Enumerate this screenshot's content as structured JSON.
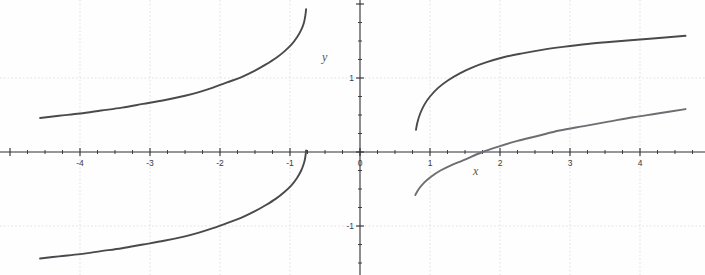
{
  "figure": {
    "title": "",
    "background_color": "#fefefe",
    "curve_color": "#4a4a4e",
    "curve_color_light": "#6d6d72",
    "axis_color": "#2f2f34",
    "gridline_color": "#e8dedf",
    "width": 705,
    "height": 275
  },
  "axes": {
    "x_label": "x",
    "y_label": "y",
    "origin_px": {
      "x": 360,
      "y": 152
    },
    "px_per_unit_x": 70,
    "px_per_unit_y": 74,
    "xlim": [
      -5.14,
      4.93
    ],
    "ylim": [
      -1.66,
      2.05
    ],
    "x_ticks_major": [
      -4,
      -3,
      -2,
      -1,
      0,
      1,
      2,
      3,
      4
    ],
    "x_tick_labels": [
      "-4",
      "-3",
      "-2",
      "-1",
      "0",
      "1",
      "2",
      "3",
      "4"
    ],
    "y_ticks_major": [
      -1,
      0,
      1
    ],
    "y_tick_labels": [
      "-1",
      "0",
      "1"
    ],
    "minor_tick_step": 0.25,
    "grid": true,
    "grid_x_lines": [
      -4,
      -3,
      -2,
      -1,
      1,
      2,
      3,
      4
    ],
    "grid_y_lines": [
      -1,
      1
    ]
  },
  "chart_data": {
    "type": "line",
    "title": "",
    "xlabel": "x",
    "ylabel": "y",
    "xlim": [
      -5.14,
      4.93
    ],
    "ylim": [
      -1.66,
      2.05
    ],
    "grid": true,
    "legend": "none",
    "x_ticks": [
      -4,
      -3,
      -2,
      -1,
      0,
      1,
      2,
      3,
      4
    ],
    "y_ticks": [
      -1,
      0,
      1
    ],
    "series": [
      {
        "name": "left-upper-branch",
        "color": "#4a4a4e",
        "points": [
          [
            -4.57,
            0.46
          ],
          [
            -4.3,
            0.49
          ],
          [
            -4.0,
            0.52
          ],
          [
            -3.7,
            0.56
          ],
          [
            -3.4,
            0.6
          ],
          [
            -3.1,
            0.65
          ],
          [
            -2.8,
            0.7
          ],
          [
            -2.5,
            0.76
          ],
          [
            -2.3,
            0.81
          ],
          [
            -2.1,
            0.87
          ],
          [
            -1.9,
            0.94
          ],
          [
            -1.7,
            1.01
          ],
          [
            -1.5,
            1.1
          ],
          [
            -1.35,
            1.18
          ],
          [
            -1.2,
            1.27
          ],
          [
            -1.08,
            1.36
          ],
          [
            -0.98,
            1.45
          ],
          [
            -0.9,
            1.55
          ],
          [
            -0.84,
            1.65
          ],
          [
            -0.8,
            1.75
          ],
          [
            -0.78,
            1.85
          ],
          [
            -0.77,
            1.93
          ]
        ]
      },
      {
        "name": "left-lower-branch",
        "color": "#4a4a4e",
        "points": [
          [
            -4.57,
            -1.44
          ],
          [
            -4.3,
            -1.41
          ],
          [
            -4.0,
            -1.38
          ],
          [
            -3.7,
            -1.34
          ],
          [
            -3.4,
            -1.3
          ],
          [
            -3.1,
            -1.25
          ],
          [
            -2.8,
            -1.2
          ],
          [
            -2.5,
            -1.14
          ],
          [
            -2.3,
            -1.09
          ],
          [
            -2.1,
            -1.03
          ],
          [
            -1.9,
            -0.96
          ],
          [
            -1.7,
            -0.89
          ],
          [
            -1.5,
            -0.8
          ],
          [
            -1.35,
            -0.72
          ],
          [
            -1.2,
            -0.63
          ],
          [
            -1.08,
            -0.54
          ],
          [
            -0.98,
            -0.45
          ],
          [
            -0.9,
            -0.35
          ],
          [
            -0.84,
            -0.25
          ],
          [
            -0.8,
            -0.15
          ],
          [
            -0.78,
            -0.06
          ],
          [
            -0.77,
            0.02
          ]
        ]
      },
      {
        "name": "right-upper-branch",
        "color": "#4a4a4e",
        "points": [
          [
            0.8,
            0.3
          ],
          [
            0.82,
            0.4
          ],
          [
            0.86,
            0.52
          ],
          [
            0.92,
            0.64
          ],
          [
            1.0,
            0.75
          ],
          [
            1.12,
            0.87
          ],
          [
            1.26,
            0.97
          ],
          [
            1.42,
            1.06
          ],
          [
            1.6,
            1.14
          ],
          [
            1.8,
            1.21
          ],
          [
            2.05,
            1.28
          ],
          [
            2.3,
            1.33
          ],
          [
            2.6,
            1.38
          ],
          [
            2.9,
            1.42
          ],
          [
            3.25,
            1.46
          ],
          [
            3.6,
            1.49
          ],
          [
            4.0,
            1.52
          ],
          [
            4.4,
            1.55
          ],
          [
            4.65,
            1.57
          ]
        ]
      },
      {
        "name": "right-lower-branch",
        "color": "#6d6d72",
        "points": [
          [
            0.79,
            -0.58
          ],
          [
            0.84,
            -0.5
          ],
          [
            0.92,
            -0.41
          ],
          [
            1.02,
            -0.33
          ],
          [
            1.15,
            -0.25
          ],
          [
            1.3,
            -0.18
          ],
          [
            1.48,
            -0.11
          ],
          [
            1.75,
            0.0
          ],
          [
            2.0,
            0.08
          ],
          [
            2.25,
            0.15
          ],
          [
            2.55,
            0.22
          ],
          [
            2.85,
            0.29
          ],
          [
            3.2,
            0.35
          ],
          [
            3.55,
            0.41
          ],
          [
            3.9,
            0.47
          ],
          [
            4.25,
            0.52
          ],
          [
            4.65,
            0.58
          ]
        ]
      }
    ]
  }
}
